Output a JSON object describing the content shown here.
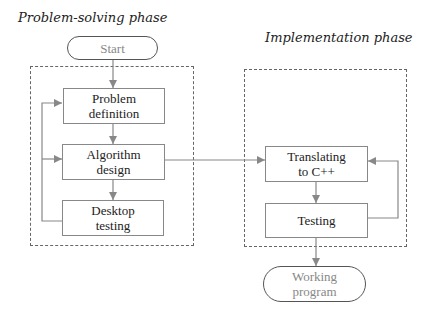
{
  "phases": {
    "problem_solving": {
      "title": "Problem-solving phase",
      "steps": [
        "Problem\ndefinition",
        "Algorithm\ndesign",
        "Desktop\ntesting"
      ]
    },
    "implementation": {
      "title": "Implementation phase",
      "steps": [
        "Translating\nto C++",
        "Testing"
      ]
    }
  },
  "terminals": {
    "start": "Start",
    "end": "Working\nprogram"
  },
  "colors": {
    "line": "#888888",
    "dash": "#666666",
    "terminal_text": "#888888"
  }
}
